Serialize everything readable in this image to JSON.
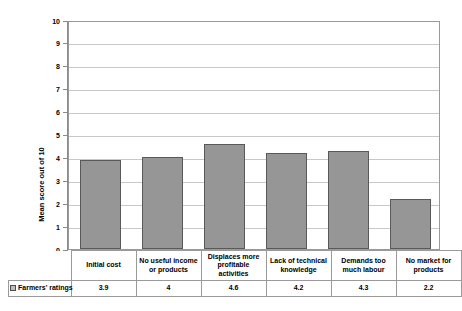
{
  "chart_data": {
    "type": "bar",
    "title": "",
    "subtitle": "",
    "xlabel": "",
    "ylabel": "Mean score out of 10",
    "ylim": [
      0,
      10
    ],
    "ytick_step": 1,
    "yticks": [
      "10",
      "9",
      "8",
      "7",
      "6",
      "5",
      "4",
      "3",
      "2",
      "1",
      "0"
    ],
    "grid": true,
    "legend_position": "data-table-row",
    "categories": [
      "Initial cost",
      "No useful income or products",
      "Displaces more profitable activities",
      "Lack of technical knowledge",
      "Demands too much labour",
      "No market for products"
    ],
    "series": [
      {
        "name": "Farmers' ratings",
        "values": [
          3.9,
          4,
          4.6,
          4.2,
          4.3,
          2.2
        ],
        "value_labels": [
          "3.9",
          "4",
          "4.6",
          "4.2",
          "4.3",
          "2.2"
        ],
        "color": "#969696",
        "border_color": "#595959"
      }
    ]
  },
  "table": {
    "legend_label": "Farmers' ratings",
    "legend_swatch_color": "#bdbdbd"
  },
  "colors": {
    "bar_fill": "#969696",
    "bar_border": "#595959",
    "gridline": "#c8c8c8",
    "axis": "#8a8a8a",
    "plot_border": "#9a9a9a",
    "text": "#000000",
    "background": "#ffffff"
  }
}
